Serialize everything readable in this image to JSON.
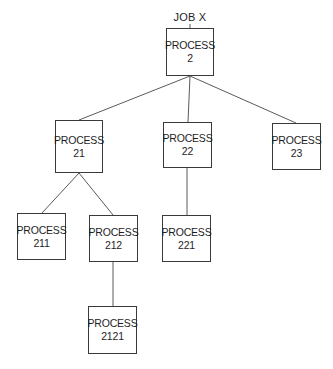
{
  "diagram": {
    "title_label": "JOB X",
    "line_color": "#5a5a5a",
    "box_border_color": "#3a3a3a",
    "nodes": [
      {
        "id": "p2",
        "line1": "PROCESS",
        "line2": "2",
        "x": 166,
        "y": 28,
        "w": 48,
        "h": 48
      },
      {
        "id": "p21",
        "line1": "PROCESS",
        "line2": "21",
        "x": 55,
        "y": 120,
        "w": 48,
        "h": 53
      },
      {
        "id": "p22",
        "line1": "PROCESS",
        "line2": "22",
        "x": 163,
        "y": 122,
        "w": 49,
        "h": 46
      },
      {
        "id": "p23",
        "line1": "PROCESS",
        "line2": "23",
        "x": 272,
        "y": 123,
        "w": 49,
        "h": 47
      },
      {
        "id": "p211",
        "line1": "PROCESS",
        "line2": "211",
        "x": 17,
        "y": 213,
        "w": 49,
        "h": 47
      },
      {
        "id": "p212",
        "line1": "PROCESS",
        "line2": "212",
        "x": 89,
        "y": 215,
        "w": 49,
        "h": 47
      },
      {
        "id": "p221",
        "line1": "PROCESS",
        "line2": "221",
        "x": 162,
        "y": 215,
        "w": 49,
        "h": 47
      },
      {
        "id": "p2121",
        "line1": "PROCESS",
        "line2": "2121",
        "x": 88,
        "y": 306,
        "w": 49,
        "h": 48
      }
    ],
    "edges": [
      {
        "from": "p2",
        "to": "p21"
      },
      {
        "from": "p2",
        "to": "p22"
      },
      {
        "from": "p2",
        "to": "p23"
      },
      {
        "from": "p21",
        "to": "p211"
      },
      {
        "from": "p21",
        "to": "p212"
      },
      {
        "from": "p22",
        "to": "p221"
      },
      {
        "from": "p212",
        "to": "p2121"
      }
    ]
  }
}
